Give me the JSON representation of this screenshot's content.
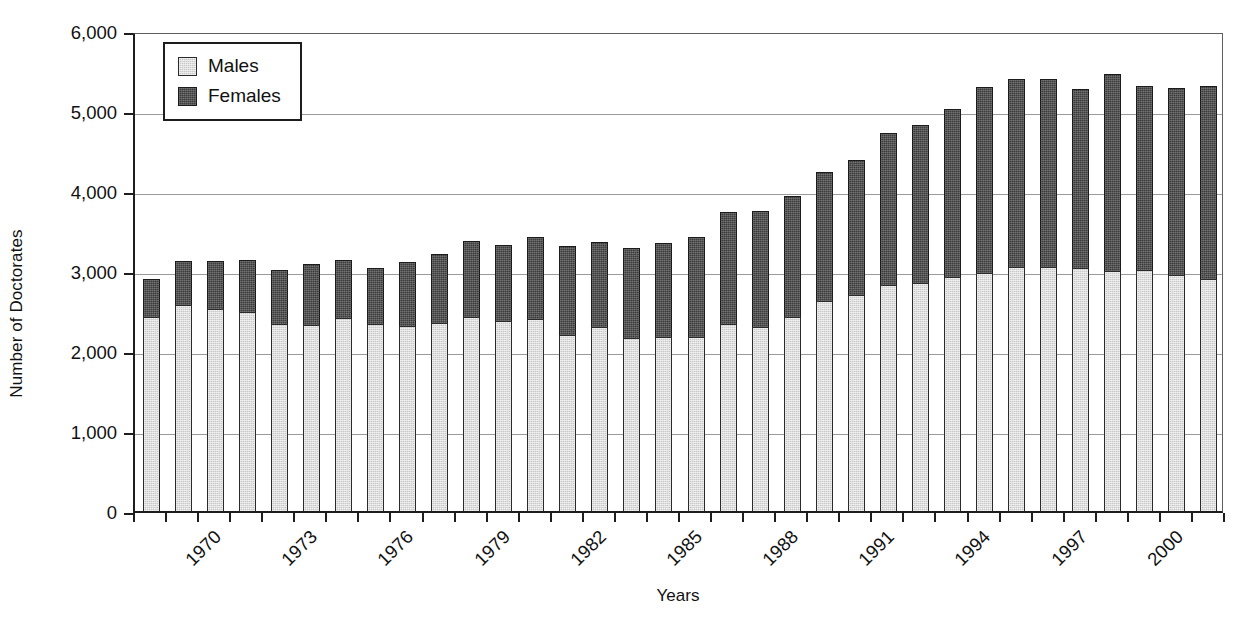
{
  "chart_data": {
    "type": "bar",
    "stacked": true,
    "title": "",
    "xlabel": "Years",
    "ylabel": "Number of Doctorates",
    "ylim": [
      0,
      6000
    ],
    "ytick_step": 1000,
    "ytick_labels": [
      "6,000",
      "5,000",
      "4,000",
      "3,000",
      "2,000",
      "1,000",
      "0"
    ],
    "ytick_values": [
      6000,
      5000,
      4000,
      3000,
      2000,
      1000,
      0
    ],
    "grid": "horizontal",
    "legend_position": "top-left inside",
    "colors": {
      "males": "#c8c8c8",
      "females": "#3c3c3c",
      "axis": "#1d1d1d",
      "gridline": "#9a9a9a"
    },
    "categories": [
      "1970",
      "1971",
      "1972",
      "1973",
      "1974",
      "1975",
      "1976",
      "1977",
      "1978",
      "1979",
      "1980",
      "1981",
      "1982",
      "1983",
      "1984",
      "1985",
      "1986",
      "1987",
      "1988",
      "1989",
      "1990",
      "1991",
      "1992",
      "1993",
      "1994",
      "1995",
      "1996",
      "1997",
      "1998",
      "1999",
      "2000",
      "2001",
      "2002",
      "2003"
    ],
    "xtick_labels_shown": [
      "1970",
      "1973",
      "1976",
      "1979",
      "1982",
      "1985",
      "1988",
      "1991",
      "1994",
      "1997",
      "2000",
      "2003"
    ],
    "series": [
      {
        "name": "Males",
        "values": [
          2420,
          2580,
          2530,
          2490,
          2340,
          2330,
          2410,
          2340,
          2310,
          2350,
          2420,
          2370,
          2400,
          2200,
          2300,
          2160,
          2180,
          2170,
          2340,
          2300,
          2430,
          2620,
          2700,
          2820,
          2850,
          2920,
          2980,
          3050,
          3050,
          3040,
          3000,
          3010,
          2950,
          2900
        ]
      },
      {
        "name": "Females",
        "values": [
          480,
          550,
          600,
          650,
          670,
          760,
          730,
          700,
          800,
          860,
          950,
          960,
          1030,
          1110,
          1060,
          1130,
          1170,
          1260,
          1400,
          1450,
          1510,
          1620,
          1690,
          1910,
          1970,
          2100,
          2320,
          2350,
          2350,
          2230,
          2460,
          2300,
          2340,
          2410
        ]
      }
    ],
    "totals": [
      2900,
      3130,
      3130,
      3140,
      3010,
      3090,
      3140,
      3040,
      3110,
      3210,
      3370,
      3330,
      3430,
      3310,
      3360,
      3290,
      3350,
      3430,
      3740,
      3750,
      3940,
      4240,
      4390,
      4730,
      4820,
      5020,
      5300,
      5400,
      5400,
      5270,
      5460,
      5310,
      5290,
      5310
    ]
  },
  "legend": {
    "items": [
      {
        "label": "Males",
        "swatch": "light-gray-swatch"
      },
      {
        "label": "Females",
        "swatch": "dark-gray-swatch"
      }
    ]
  }
}
